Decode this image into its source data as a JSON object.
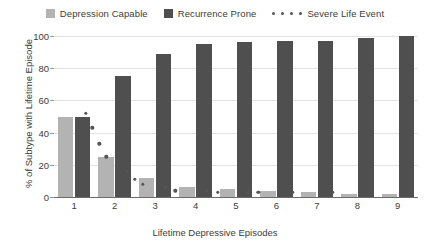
{
  "chart_data": {
    "type": "bar",
    "title": "",
    "xlabel": "Lifetime Depressive Episodes",
    "ylabel": "% of Subtype with Lifetime Episode",
    "categories": [
      "1",
      "2",
      "3",
      "4",
      "5",
      "6",
      "7",
      "8",
      "9"
    ],
    "ylim": [
      0,
      100
    ],
    "yticks": [
      0,
      20,
      40,
      60,
      80,
      100
    ],
    "grid": true,
    "legend_position": "top-center",
    "series": [
      {
        "name": "Depression Capable",
        "type": "bar",
        "color": "#b3b3b3",
        "values": [
          50,
          25,
          12,
          6,
          5,
          4,
          3,
          2,
          2
        ]
      },
      {
        "name": "Recurrence Prone",
        "type": "bar",
        "color": "#4f4f4f",
        "values": [
          50,
          75,
          89,
          95,
          96,
          97,
          97,
          99,
          100
        ]
      },
      {
        "name": "Severe Life Event",
        "type": "scatter",
        "color": "#555555",
        "values": [
          52,
          43,
          33,
          25,
          16,
          11,
          8,
          6,
          4,
          4,
          3,
          3,
          3,
          3,
          3
        ],
        "x": [
          1.28,
          1.45,
          1.62,
          1.79,
          2.3,
          2.5,
          2.7,
          3.25,
          3.5,
          4.28,
          4.55,
          5.3,
          5.55,
          6.4,
          7.4
        ]
      }
    ]
  },
  "legend": {
    "entries": [
      {
        "label": "Depression Capable",
        "marker": "square-swatch-light",
        "color": "#b3b3b3"
      },
      {
        "label": "Recurrence Prone",
        "marker": "square-swatch-dark",
        "color": "#4f4f4f"
      },
      {
        "label": "Severe Life Event",
        "marker": "dot-series",
        "color": "#555555"
      }
    ]
  }
}
